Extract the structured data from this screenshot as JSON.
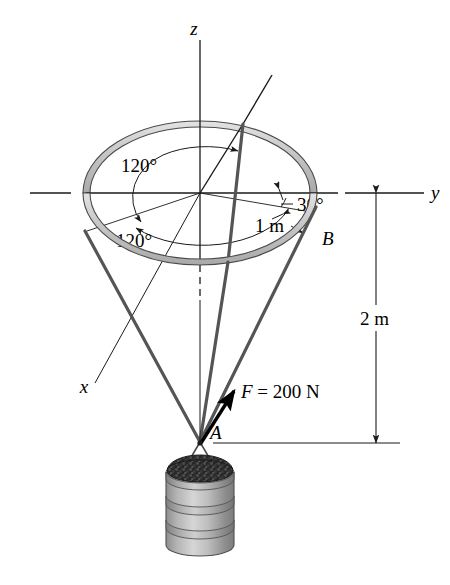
{
  "figure": {
    "type": "engineering-mechanics-free-body-diagram"
  },
  "axes": {
    "z_label": "z",
    "y_label": "y",
    "x_label": "x"
  },
  "angles": {
    "upper_120": "120°",
    "lower_120": "120°",
    "thirty": "30°"
  },
  "dimensions": {
    "radius": "1 m",
    "height": "2 m"
  },
  "points": {
    "a_label": "A",
    "b_label": "B"
  },
  "force": {
    "label": "F = 200 N",
    "symbol": "F",
    "equals": "=",
    "magnitude": "200",
    "unit": "N"
  },
  "colors": {
    "line": "#1a1a1a",
    "ring_fill": "#c9c9c9",
    "ring_edge": "#4a4a4a",
    "cable": "#555555",
    "barrel_body": "#b8b8b8",
    "barrel_shade": "#8d8d8d",
    "gravel": "#2a2a2a",
    "background": "#ffffff"
  },
  "geometry": {
    "ring_center": [
      200,
      193
    ],
    "ring_rx": 117,
    "ring_ry": 72,
    "node_a": [
      200,
      442
    ],
    "cable_anchor_left": [
      85,
      232
    ],
    "cable_anchor_back": [
      242,
      122
    ],
    "cable_anchor_b": [
      316,
      207
    ]
  }
}
